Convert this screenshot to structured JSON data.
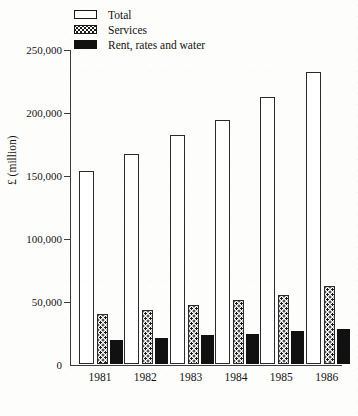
{
  "legend": {
    "items": [
      {
        "label": "Total",
        "swatch": "outlined-white-rect",
        "color": "#ffffff"
      },
      {
        "label": "Services",
        "swatch": "dotted-pattern-rect",
        "color": "#ffffff"
      },
      {
        "label": "Rent, rates and water",
        "swatch": "solid-black-rect",
        "color": "#111111"
      }
    ]
  },
  "axis": {
    "y_title": "£ (million)",
    "y_ticks": [
      "250,000",
      "200,000",
      "150,000",
      "100,000",
      "50,000",
      "0"
    ],
    "x_ticks": [
      "1981",
      "1982",
      "1983",
      "1984",
      "1985",
      "1986"
    ]
  },
  "chart_data": {
    "type": "bar",
    "title": "",
    "xlabel": "",
    "ylabel": "£ (million)",
    "categories": [
      "1981",
      "1982",
      "1983",
      "1984",
      "1985",
      "1986"
    ],
    "series": [
      {
        "name": "Total",
        "values": [
          153000,
          167000,
          182000,
          194000,
          212000,
          232000
        ]
      },
      {
        "name": "Services",
        "values": [
          40000,
          43000,
          47000,
          51000,
          55000,
          62000
        ]
      },
      {
        "name": "Rent, rates and water",
        "values": [
          19000,
          21000,
          23000,
          24000,
          26000,
          28000
        ]
      }
    ],
    "ylim": [
      0,
      250000
    ],
    "ytick_values": [
      0,
      50000,
      100000,
      150000,
      200000,
      250000
    ],
    "grid": false,
    "legend_position": "top-left"
  }
}
